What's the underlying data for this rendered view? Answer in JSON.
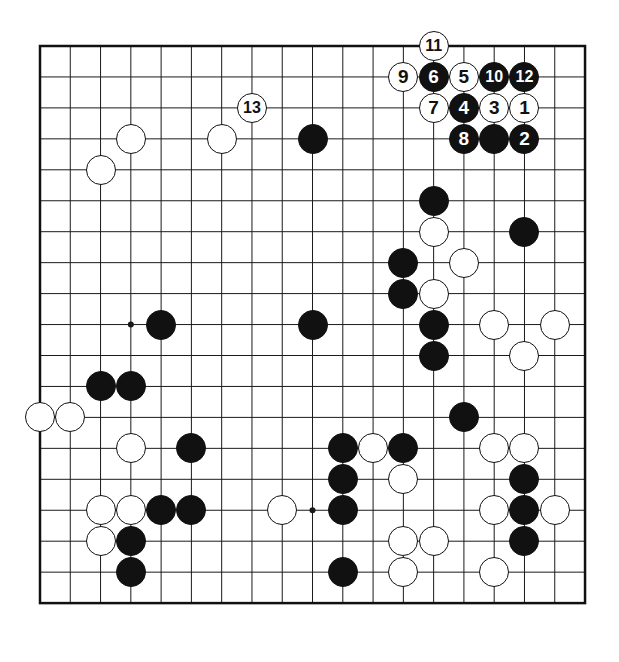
{
  "board": {
    "title": "Go game diagram",
    "size": 19,
    "visible_columns": 19,
    "visible_rows": 19,
    "geometry": {
      "left": 40,
      "top": 46,
      "col_spacing": 30.28,
      "row_spacing": 30.95,
      "stone_diameter": 30,
      "border_width": 2.5,
      "line_width": 1
    },
    "colors": {
      "background": "#ffffff",
      "line": "#1a1a1a",
      "border": "#111111",
      "black_stone": "#111111",
      "white_stone": "#ffffff",
      "black_label_text": "#ffffff",
      "white_label_text": "#111111"
    },
    "star_points": [
      {
        "col": 3,
        "row": 3
      },
      {
        "col": 9,
        "row": 3
      },
      {
        "col": 15,
        "row": 3
      },
      {
        "col": 3,
        "row": 9
      },
      {
        "col": 9,
        "row": 9
      },
      {
        "col": 15,
        "row": 9
      },
      {
        "col": 3,
        "row": 15
      },
      {
        "col": 9,
        "row": 15
      },
      {
        "col": 15,
        "row": 15
      }
    ],
    "numbered_moves": [
      {
        "label": "1",
        "color": "white",
        "col": 16,
        "row": 2
      },
      {
        "label": "2",
        "color": "black",
        "col": 16,
        "row": 3
      },
      {
        "label": "3",
        "color": "white",
        "col": 15,
        "row": 2
      },
      {
        "label": "4",
        "color": "black",
        "col": 14,
        "row": 2
      },
      {
        "label": "5",
        "color": "white",
        "col": 14,
        "row": 1
      },
      {
        "label": "6",
        "color": "black",
        "col": 13,
        "row": 1
      },
      {
        "label": "7",
        "color": "white",
        "col": 13,
        "row": 2
      },
      {
        "label": "8",
        "color": "black",
        "col": 14,
        "row": 3
      },
      {
        "label": "9",
        "color": "white",
        "col": 12,
        "row": 1
      },
      {
        "label": "10",
        "color": "black",
        "col": 15,
        "row": 1
      },
      {
        "label": "11",
        "color": "white",
        "col": 13,
        "row": 0
      },
      {
        "label": "12",
        "color": "black",
        "col": 16,
        "row": 1
      },
      {
        "label": "13",
        "color": "white",
        "col": 7,
        "row": 2
      }
    ],
    "black_stones": [
      {
        "col": 9,
        "row": 3
      },
      {
        "col": 15,
        "row": 3
      },
      {
        "col": 13,
        "row": 5
      },
      {
        "col": 16,
        "row": 6
      },
      {
        "col": 12,
        "row": 7
      },
      {
        "col": 12,
        "row": 8
      },
      {
        "col": 4,
        "row": 9
      },
      {
        "col": 9,
        "row": 9
      },
      {
        "col": 13,
        "row": 9
      },
      {
        "col": 13,
        "row": 10
      },
      {
        "col": 2,
        "row": 11
      },
      {
        "col": 3,
        "row": 11
      },
      {
        "col": 14,
        "row": 12
      },
      {
        "col": 10,
        "row": 13
      },
      {
        "col": 5,
        "row": 13
      },
      {
        "col": 12,
        "row": 13
      },
      {
        "col": 10,
        "row": 14
      },
      {
        "col": 16,
        "row": 14
      },
      {
        "col": 4,
        "row": 15
      },
      {
        "col": 5,
        "row": 15
      },
      {
        "col": 10,
        "row": 15
      },
      {
        "col": 16,
        "row": 15
      },
      {
        "col": 3,
        "row": 16
      },
      {
        "col": 16,
        "row": 16
      },
      {
        "col": 3,
        "row": 17
      },
      {
        "col": 10,
        "row": 17
      }
    ],
    "white_stones": [
      {
        "col": 3,
        "row": 3
      },
      {
        "col": 2,
        "row": 4
      },
      {
        "col": 6,
        "row": 3
      },
      {
        "col": 13,
        "row": 6
      },
      {
        "col": 14,
        "row": 7
      },
      {
        "col": 13,
        "row": 8
      },
      {
        "col": 15,
        "row": 9
      },
      {
        "col": 17,
        "row": 9
      },
      {
        "col": 16,
        "row": 10
      },
      {
        "col": 0,
        "row": 12
      },
      {
        "col": 1,
        "row": 12
      },
      {
        "col": 3,
        "row": 13
      },
      {
        "col": 11,
        "row": 13
      },
      {
        "col": 15,
        "row": 13
      },
      {
        "col": 16,
        "row": 13
      },
      {
        "col": 12,
        "row": 14
      },
      {
        "col": 2,
        "row": 15
      },
      {
        "col": 3,
        "row": 15
      },
      {
        "col": 8,
        "row": 15
      },
      {
        "col": 15,
        "row": 15
      },
      {
        "col": 17,
        "row": 15
      },
      {
        "col": 2,
        "row": 16
      },
      {
        "col": 12,
        "row": 16
      },
      {
        "col": 13,
        "row": 16
      },
      {
        "col": 15,
        "row": 17
      },
      {
        "col": 12,
        "row": 17
      }
    ]
  }
}
